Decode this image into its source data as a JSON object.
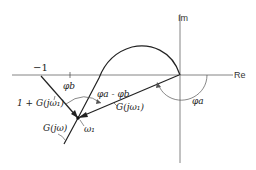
{
  "diagram": {
    "type": "nyquist-plot",
    "axes": {
      "real_label": "Re",
      "imag_label": "Im"
    },
    "points": {
      "critical_point_label": "−1",
      "frequency_point_label": "ω₁"
    },
    "vectors": {
      "open_loop_at_w1": "G(jω₁)",
      "closed_loop_at_w1": "1 + G(jω₁)"
    },
    "curve": {
      "label": "G(jω)"
    },
    "angles": {
      "phi_a": "φa",
      "phi_b": "φb",
      "phi_diff": "φa - φb"
    },
    "colors": {
      "line": "#222222",
      "axis": "#555555"
    }
  }
}
